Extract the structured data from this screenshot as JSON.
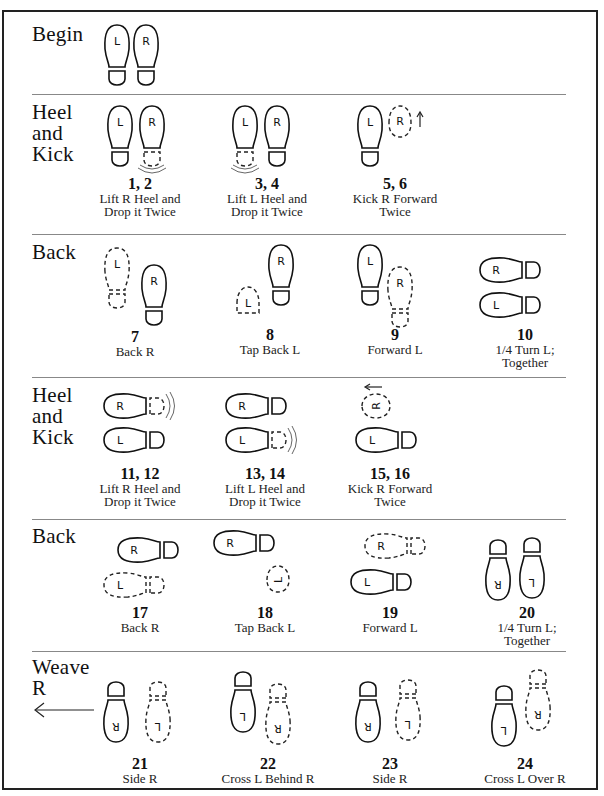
{
  "sections": [
    {
      "label": "Begin"
    },
    {
      "label": "Heel\nand\nKick"
    },
    {
      "label": "Back"
    },
    {
      "label": "Heel\nand\nKick"
    },
    {
      "label": "Back"
    },
    {
      "label": "Weave\nR"
    }
  ],
  "steps": [
    {
      "num": "1, 2",
      "desc": "Lift R Heel and\nDrop it Twice"
    },
    {
      "num": "3, 4",
      "desc": "Lift L Heel and\nDrop it Twice"
    },
    {
      "num": "5, 6",
      "desc": "Kick R Forward\nTwice"
    },
    {
      "num": "7",
      "desc": "Back R"
    },
    {
      "num": "8",
      "desc": "Tap Back L"
    },
    {
      "num": "9",
      "desc": "Forward L"
    },
    {
      "num": "10",
      "desc": "1/4 Turn L;\nTogether"
    },
    {
      "num": "11, 12",
      "desc": "Lift R Heel and\nDrop it Twice"
    },
    {
      "num": "13, 14",
      "desc": "Lift L Heel and\nDrop it Twice"
    },
    {
      "num": "15, 16",
      "desc": "Kick R Forward\nTwice"
    },
    {
      "num": "17",
      "desc": "Back R"
    },
    {
      "num": "18",
      "desc": "Tap Back L"
    },
    {
      "num": "19",
      "desc": "Forward L"
    },
    {
      "num": "20",
      "desc": "1/4 Turn L;\nTogether"
    },
    {
      "num": "21",
      "desc": "Side R"
    },
    {
      "num": "22",
      "desc": "Cross L Behind R"
    },
    {
      "num": "23",
      "desc": "Side R"
    },
    {
      "num": "24",
      "desc": "Cross L Over R"
    }
  ],
  "foot_labels": {
    "left": "L",
    "right": "R"
  },
  "icons": {
    "footprint_solid": "footprint-icon",
    "footprint_dashed": "footprint-dashed-icon",
    "direction_arrow": "arrow-icon",
    "heel_tap_waves": "heel-tap-waves-icon"
  }
}
